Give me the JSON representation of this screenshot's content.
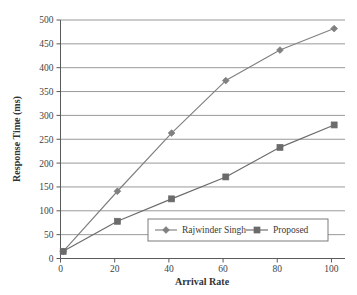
{
  "chart_data": {
    "type": "line",
    "title": "",
    "xlabel": "Arrival Rate",
    "ylabel": "Response Time (ms)",
    "xlim": [
      0,
      105
    ],
    "ylim": [
      0,
      500
    ],
    "x_ticks": [
      0,
      20,
      40,
      60,
      80,
      100
    ],
    "y_ticks": [
      0,
      50,
      100,
      150,
      200,
      250,
      300,
      350,
      400,
      450,
      500
    ],
    "grid": "horizontal",
    "legend_position": "inside-bottom-center",
    "x": [
      1,
      21,
      41,
      61,
      81,
      101
    ],
    "series": [
      {
        "name": "Rajwinder Singh",
        "marker": "diamond",
        "color": "#808080",
        "values": [
          15,
          141,
          263,
          373,
          437,
          482
        ]
      },
      {
        "name": "Proposed",
        "marker": "square",
        "color": "#6b6b6b",
        "values": [
          15,
          78,
          125,
          171,
          233,
          280
        ]
      }
    ]
  },
  "colors": {
    "background": "#ffffff",
    "axis": "#5a5a5a",
    "grid": "#8d8d8d",
    "text": "#3a3a3a"
  }
}
